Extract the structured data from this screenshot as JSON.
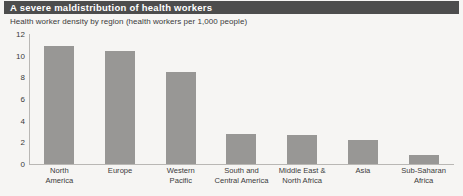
{
  "header": {
    "title": "A severe maldistribution of health workers",
    "band_color": "#4d4d4d",
    "title_color": "#ffffff"
  },
  "subtitle": "Health worker density by region (health workers per 1,000 people)",
  "figure": {
    "background_color": "#f6f5f3",
    "axis_color": "#b9b7b4",
    "bar_color": "#989795",
    "text_color": "#3b3b3b"
  },
  "chart_data": {
    "type": "bar",
    "title": "A severe maldistribution of health workers",
    "subtitle": "Health worker density by region (health workers per 1,000 people)",
    "xlabel": "",
    "ylabel": "",
    "ylim": [
      0,
      12
    ],
    "yticks": [
      0,
      2,
      4,
      6,
      8,
      10,
      12
    ],
    "ytick_labels": [
      "0",
      "2",
      "4",
      "6",
      "8",
      "10",
      "12"
    ],
    "grid": false,
    "legend": false,
    "categories": [
      "North America",
      "Europe",
      "Western Pacific",
      "South and Central America",
      "Middle East & North Africa",
      "Asia",
      "Sub-Saharan Africa"
    ],
    "category_lines": [
      [
        "North",
        "America"
      ],
      [
        "Europe",
        ""
      ],
      [
        "Western",
        "Pacific"
      ],
      [
        "South and",
        "Central America"
      ],
      [
        "Middle East &",
        "North Africa"
      ],
      [
        "Asia",
        ""
      ],
      [
        "Sub-Saharan",
        "Africa"
      ]
    ],
    "values": [
      10.9,
      10.4,
      8.5,
      2.8,
      2.7,
      2.2,
      0.8
    ],
    "series": [
      {
        "name": "Health worker density",
        "values": [
          10.9,
          10.4,
          8.5,
          2.8,
          2.7,
          2.2,
          0.8
        ]
      }
    ]
  }
}
